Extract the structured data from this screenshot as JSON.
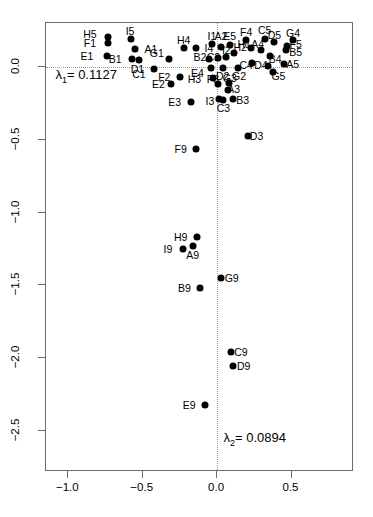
{
  "chart_data": {
    "type": "scatter",
    "title": "",
    "xlabel": "",
    "ylabel": "",
    "xlim": [
      -1.15,
      0.92
    ],
    "ylim": [
      -2.78,
      0.3
    ],
    "grid": false,
    "legend": null,
    "reference_lines": {
      "horizontal": 0.0,
      "vertical": 0.0,
      "style": "dotted"
    },
    "xticks": [
      -1.0,
      -0.5,
      0.0,
      0.5
    ],
    "xticklabels": [
      "-1.0",
      "-0.5",
      "0.0",
      "0.5"
    ],
    "yticks": [
      0.0,
      -0.5,
      -1.0,
      -1.5,
      -2.0,
      -2.5
    ],
    "yticklabels": [
      "0.0",
      "-0.5",
      "-1.0",
      "-1.5",
      "-2.0",
      "-2.5"
    ],
    "annotations": [
      {
        "name": "eigenvalue-1",
        "text_prefix": "λ",
        "text_sub": "1",
        "text_suffix": "= 0.1127",
        "x": -1.08,
        "y": -0.07
      },
      {
        "name": "eigenvalue-2",
        "text_prefix": "λ",
        "text_sub": "2",
        "text_suffix": "= 0.0894",
        "x": 0.05,
        "y": -2.56
      }
    ],
    "points": [
      {
        "label": "H5",
        "x": -0.73,
        "y": 0.205,
        "lx": -0.855,
        "ly": 0.225
      },
      {
        "label": "F1",
        "x": -0.73,
        "y": 0.162,
        "lx": -0.855,
        "ly": 0.162
      },
      {
        "label": "E1",
        "x": -0.74,
        "y": 0.075,
        "lx": -0.875,
        "ly": 0.075
      },
      {
        "label": "B1",
        "x": -0.575,
        "y": 0.05,
        "lx": -0.685,
        "ly": 0.05
      },
      {
        "label": "I5",
        "x": -0.58,
        "y": 0.192,
        "lx": -0.585,
        "ly": 0.248
      },
      {
        "label": "A1",
        "x": -0.555,
        "y": 0.125,
        "lx": -0.445,
        "ly": 0.125
      },
      {
        "label": "D1",
        "x": -0.525,
        "y": 0.043,
        "lx": -0.535,
        "ly": -0.013
      },
      {
        "label": "C1",
        "x": -0.425,
        "y": -0.018,
        "lx": -0.525,
        "ly": -0.05
      },
      {
        "label": "G1",
        "x": -0.325,
        "y": 0.056,
        "lx": -0.405,
        "ly": 0.093
      },
      {
        "label": "F2",
        "x": -0.25,
        "y": -0.068,
        "lx": -0.355,
        "ly": -0.068
      },
      {
        "label": "E2",
        "x": -0.31,
        "y": -0.118,
        "lx": -0.395,
        "ly": -0.118
      },
      {
        "label": "E3",
        "x": -0.175,
        "y": -0.243,
        "lx": -0.285,
        "ly": -0.243
      },
      {
        "label": "H4",
        "x": -0.225,
        "y": 0.13,
        "lx": -0.225,
        "ly": 0.186
      },
      {
        "label": "I4",
        "x": -0.14,
        "y": 0.13,
        "lx": -0.055,
        "ly": 0.13
      },
      {
        "label": "I1",
        "x": -0.035,
        "y": 0.155,
        "lx": -0.035,
        "ly": 0.212
      },
      {
        "label": "A2",
        "x": 0.025,
        "y": 0.138,
        "lx": 0.025,
        "ly": 0.212
      },
      {
        "label": "E5",
        "x": 0.085,
        "y": 0.15,
        "lx": 0.085,
        "ly": 0.212
      },
      {
        "label": "B2",
        "x": -0.055,
        "y": 0.055,
        "lx": -0.115,
        "ly": 0.068
      },
      {
        "label": "C2",
        "x": 0.005,
        "y": 0.062,
        "lx": -0.025,
        "ly": 0.068
      },
      {
        "label": "I2",
        "x": 0.062,
        "y": 0.068,
        "lx": 0.062,
        "ly": 0.112
      },
      {
        "label": "H2",
        "x": 0.115,
        "y": 0.095,
        "lx": 0.155,
        "ly": 0.138
      },
      {
        "label": "E4",
        "x": -0.04,
        "y": -0.012,
        "lx": -0.132,
        "ly": -0.043
      },
      {
        "label": "D2",
        "x": 0.038,
        "y": -0.012,
        "lx": 0.038,
        "ly": -0.062
      },
      {
        "label": "G2",
        "x": 0.142,
        "y": -0.012,
        "lx": 0.148,
        "ly": -0.062
      },
      {
        "label": "H3",
        "x": -0.025,
        "y": -0.075,
        "lx": -0.152,
        "ly": -0.087
      },
      {
        "label": "F3",
        "x": 0.005,
        "y": -0.118,
        "lx": -0.028,
        "ly": -0.087
      },
      {
        "label": "G3",
        "x": 0.082,
        "y": -0.112,
        "lx": 0.085,
        "ly": -0.075
      },
      {
        "label": "A3",
        "x": 0.075,
        "y": -0.162,
        "lx": 0.112,
        "ly": -0.15
      },
      {
        "label": "I3",
        "x": 0.01,
        "y": -0.218,
        "lx": -0.048,
        "ly": -0.237
      },
      {
        "label": "C3",
        "x": 0.042,
        "y": -0.23,
        "lx": 0.042,
        "ly": -0.28
      },
      {
        "label": "B3",
        "x": 0.11,
        "y": -0.218,
        "lx": 0.172,
        "ly": -0.23
      },
      {
        "label": "F4",
        "x": 0.195,
        "y": 0.18,
        "lx": 0.195,
        "ly": 0.237
      },
      {
        "label": "H1",
        "x": 0.225,
        "y": 0.13,
        "lx": 0.182,
        "ly": 0.155
      },
      {
        "label": "C5",
        "x": 0.32,
        "y": 0.192,
        "lx": 0.32,
        "ly": 0.25
      },
      {
        "label": "A4",
        "x": 0.295,
        "y": 0.118,
        "lx": 0.272,
        "ly": 0.155
      },
      {
        "label": "D5",
        "x": 0.385,
        "y": 0.168,
        "lx": 0.385,
        "ly": 0.218
      },
      {
        "label": "G4",
        "x": 0.51,
        "y": 0.18,
        "lx": 0.51,
        "ly": 0.23
      },
      {
        "label": "F5",
        "x": 0.47,
        "y": 0.142,
        "lx": 0.528,
        "ly": 0.155
      },
      {
        "label": "B5",
        "x": 0.465,
        "y": 0.112,
        "lx": 0.528,
        "ly": 0.1
      },
      {
        "label": "B4",
        "x": 0.355,
        "y": 0.075,
        "lx": 0.39,
        "ly": 0.05
      },
      {
        "label": "C4",
        "x": 0.232,
        "y": 0.025,
        "lx": 0.195,
        "ly": 0.013
      },
      {
        "label": "D4",
        "x": 0.345,
        "y": 0.005,
        "lx": 0.295,
        "ly": 0.012
      },
      {
        "label": "A5",
        "x": 0.448,
        "y": 0.018,
        "lx": 0.508,
        "ly": 0.018
      },
      {
        "label": "G5",
        "x": 0.375,
        "y": -0.038,
        "lx": 0.412,
        "ly": -0.062
      },
      {
        "label": "D3",
        "x": 0.205,
        "y": -0.475,
        "lx": 0.265,
        "ly": -0.475
      },
      {
        "label": "F9",
        "x": -0.14,
        "y": -0.562,
        "lx": -0.245,
        "ly": -0.562
      },
      {
        "label": "H9",
        "x": -0.135,
        "y": -1.168,
        "lx": -0.245,
        "ly": -1.168
      },
      {
        "label": "A9",
        "x": -0.165,
        "y": -1.23,
        "lx": -0.165,
        "ly": -1.292
      },
      {
        "label": "I9",
        "x": -0.228,
        "y": -1.248,
        "lx": -0.33,
        "ly": -1.248
      },
      {
        "label": "G9",
        "x": 0.028,
        "y": -1.45,
        "lx": 0.098,
        "ly": -1.45
      },
      {
        "label": "B9",
        "x": -0.113,
        "y": -1.52,
        "lx": -0.22,
        "ly": -1.52
      },
      {
        "label": "C9",
        "x": 0.095,
        "y": -1.96,
        "lx": 0.16,
        "ly": -1.96
      },
      {
        "label": "D9",
        "x": 0.108,
        "y": -2.052,
        "lx": 0.178,
        "ly": -2.052
      },
      {
        "label": "E9",
        "x": -0.082,
        "y": -2.318,
        "lx": -0.188,
        "ly": -2.318
      }
    ]
  }
}
